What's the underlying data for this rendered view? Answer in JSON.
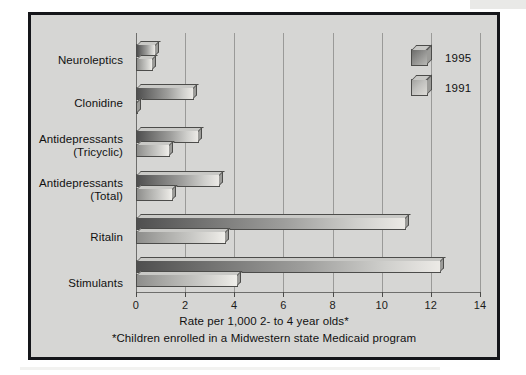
{
  "figure": {
    "background_color": "#d6d6d4",
    "border_color": "#15161a"
  },
  "chart_data": {
    "type": "bar",
    "orientation": "horizontal",
    "title": "",
    "xlabel": "Rate per 1,000 2- to 4 year olds*",
    "ylabel": "",
    "footnote": "*Children enrolled in a Midwestern state Medicaid program",
    "xlim": [
      0,
      14
    ],
    "xticks": [
      0,
      2,
      4,
      6,
      8,
      10,
      12,
      14
    ],
    "xtick_labels": [
      "0",
      "2",
      "4",
      "6",
      "8",
      "10",
      "12",
      "14"
    ],
    "grid": true,
    "grid_axis": "x",
    "legend_position": "top-right",
    "categories": [
      "Neuroleptics",
      "Clonidine",
      "Antidepressants\n(Tricyclic)",
      "Antidepressants\n(Total)",
      "Ritalin",
      "Stimulants"
    ],
    "series": [
      {
        "name": "1995",
        "color": "#6f6f6e",
        "values": [
          0.8,
          2.35,
          2.55,
          3.4,
          11.0,
          12.4
        ]
      },
      {
        "name": "1991",
        "color": "#c6c6c3",
        "values": [
          0.7,
          0.1,
          1.4,
          1.5,
          3.65,
          4.15
        ]
      }
    ]
  },
  "legend": {
    "items": [
      {
        "label": "1995",
        "series": "1995"
      },
      {
        "label": "1991",
        "series": "1991"
      }
    ]
  }
}
